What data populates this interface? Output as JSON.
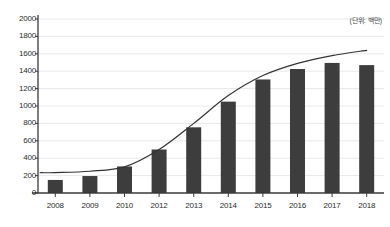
{
  "chart_data": {
    "type": "bar",
    "title": "",
    "subtitle": "",
    "xlabel": "",
    "ylabel": "",
    "annotation": "(단위: 백만)",
    "grid": true,
    "legend_position": "none",
    "ylim": [
      0,
      2000
    ],
    "ytick_step": 200,
    "yticks": [
      0,
      200,
      400,
      600,
      800,
      1000,
      1200,
      1400,
      1600,
      1800,
      2000
    ],
    "ytick_labels": [
      "0",
      "200",
      "400",
      "600",
      "800",
      "1000",
      "1200",
      "1400",
      "1600",
      "1800",
      "2000"
    ],
    "categories": [
      "2008",
      "2009",
      "2010",
      "2012",
      "2013",
      "2014",
      "2015",
      "2016",
      "2017",
      "2018"
    ],
    "values": [
      150,
      195,
      305,
      500,
      755,
      1050,
      1305,
      1425,
      1495,
      1470
    ],
    "series": [
      {
        "name": "bars",
        "type": "bar",
        "color": "#3d3d3d",
        "values": [
          150,
          195,
          305,
          500,
          755,
          1050,
          1305,
          1425,
          1495,
          1470
        ]
      },
      {
        "name": "trend-curve",
        "type": "line",
        "color": "#333333",
        "values": [
          235,
          250,
          300,
          500,
          800,
          1120,
          1350,
          1490,
          1580,
          1640
        ]
      }
    ],
    "colors": {
      "bar": "#3d3d3d",
      "line": "#333333",
      "grid": "#e8e8ec",
      "axis": "#3a3a3a",
      "text": "#2b2b2b",
      "background": "#ffffff"
    }
  }
}
